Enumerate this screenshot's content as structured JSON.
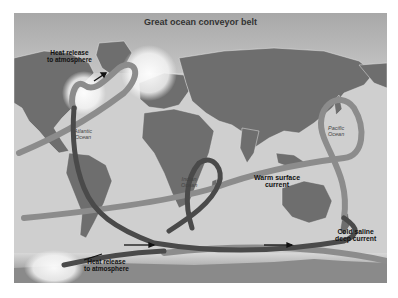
{
  "diagram": {
    "title": "Great ocean conveyor belt",
    "labels": {
      "heat_release_north_line1": "Heat release",
      "heat_release_north_line2": "to atmosphere",
      "heat_release_south_line1": "Heat release",
      "heat_release_south_line2": "to atmosphere",
      "warm_surface_line1": "Warm surface",
      "warm_surface_line2": "current",
      "cold_deep_line1": "Cold saline",
      "cold_deep_line2": "deep current"
    },
    "oceans": {
      "atlantic_line1": "Atlantic",
      "atlantic_line2": "Ocean",
      "indian_line1": "Indian",
      "indian_line2": "Ocean",
      "pacific_line1": "Pacific",
      "pacific_line2": "Ocean"
    },
    "colors": {
      "background": "#b9b9b9",
      "land": "#6e6e6e",
      "warm_current": "#8c8c8c",
      "cold_current": "#4a4a4a",
      "heat_glow": "#f2f2f2"
    }
  }
}
